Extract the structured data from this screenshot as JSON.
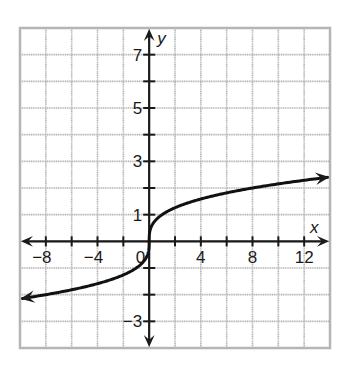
{
  "chart_data": {
    "type": "line",
    "title": "",
    "xlabel": "x",
    "ylabel": "y",
    "xlim": [
      -10,
      14
    ],
    "ylim": [
      -4,
      8
    ],
    "grid": true,
    "grid_step": {
      "x": 2,
      "y": 1
    },
    "x_tick_labels": [
      {
        "value": -8,
        "label": "−8"
      },
      {
        "value": -4,
        "label": "−4"
      },
      {
        "value": 0,
        "label": "0"
      },
      {
        "value": 4,
        "label": "4"
      },
      {
        "value": 8,
        "label": "8"
      },
      {
        "value": 12,
        "label": "12"
      }
    ],
    "y_tick_labels": [
      {
        "value": 7,
        "label": "7"
      },
      {
        "value": 5,
        "label": "5"
      },
      {
        "value": 3,
        "label": "3"
      },
      {
        "value": 1,
        "label": "1"
      },
      {
        "value": -3,
        "label": "−3"
      }
    ],
    "series": [
      {
        "name": "y = cube root of x",
        "function": "cbrt",
        "x_range": [
          -9.8,
          13.8
        ],
        "arrows": "both",
        "points": [
          {
            "x": -9.8,
            "y": -2.14
          },
          {
            "x": -8,
            "y": -2
          },
          {
            "x": -4,
            "y": -1.59
          },
          {
            "x": -1,
            "y": -1
          },
          {
            "x": 0,
            "y": 0
          },
          {
            "x": 1,
            "y": 1
          },
          {
            "x": 4,
            "y": 1.59
          },
          {
            "x": 8,
            "y": 2
          },
          {
            "x": 12,
            "y": 2.29
          },
          {
            "x": 13.8,
            "y": 2.4
          }
        ]
      }
    ],
    "legend": null
  },
  "colors": {
    "grid": "#b5b5b5",
    "axis": "#1a1a1a",
    "curve": "#111111",
    "background": "#ffffff"
  }
}
